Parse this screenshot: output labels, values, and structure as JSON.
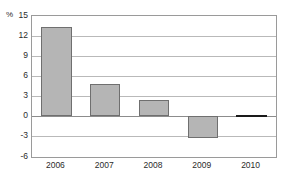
{
  "chart_data": {
    "type": "bar",
    "title": "",
    "subtitle": "",
    "xlabel": "",
    "ylabel": "%",
    "unit_label": "%",
    "categories": [
      "2006",
      "2007",
      "2008",
      "2009",
      "2010"
    ],
    "values": [
      13.3,
      4.8,
      2.4,
      -3.2,
      0.1
    ],
    "series": [
      {
        "name": "",
        "values": [
          13.3,
          4.8,
          2.4,
          -3.2,
          0.1
        ]
      }
    ],
    "ylim": [
      -6,
      15
    ],
    "xlim_categories": 5,
    "y_ticks": [
      15,
      12,
      9,
      6,
      3,
      0,
      -3,
      -6
    ],
    "y_tick_labels": [
      "15",
      "12",
      "9",
      "6",
      "3",
      "0",
      "-3",
      "-6"
    ],
    "x_tick_labels": [
      "2006",
      "2007",
      "2008",
      "2009",
      "2010"
    ],
    "grid": true,
    "grid_axis": "y",
    "legend": false,
    "legend_position": "none",
    "bar_color": "#b5b5b5",
    "bar_border_color": "#6f6f6f",
    "gridline_color": "#b9b9b9",
    "zero_line_color": "#8c8c8c",
    "frame_color": "#9a9a9a",
    "text_color": "#2b2b2b",
    "background_color": "#ffffff",
    "annotations": []
  }
}
